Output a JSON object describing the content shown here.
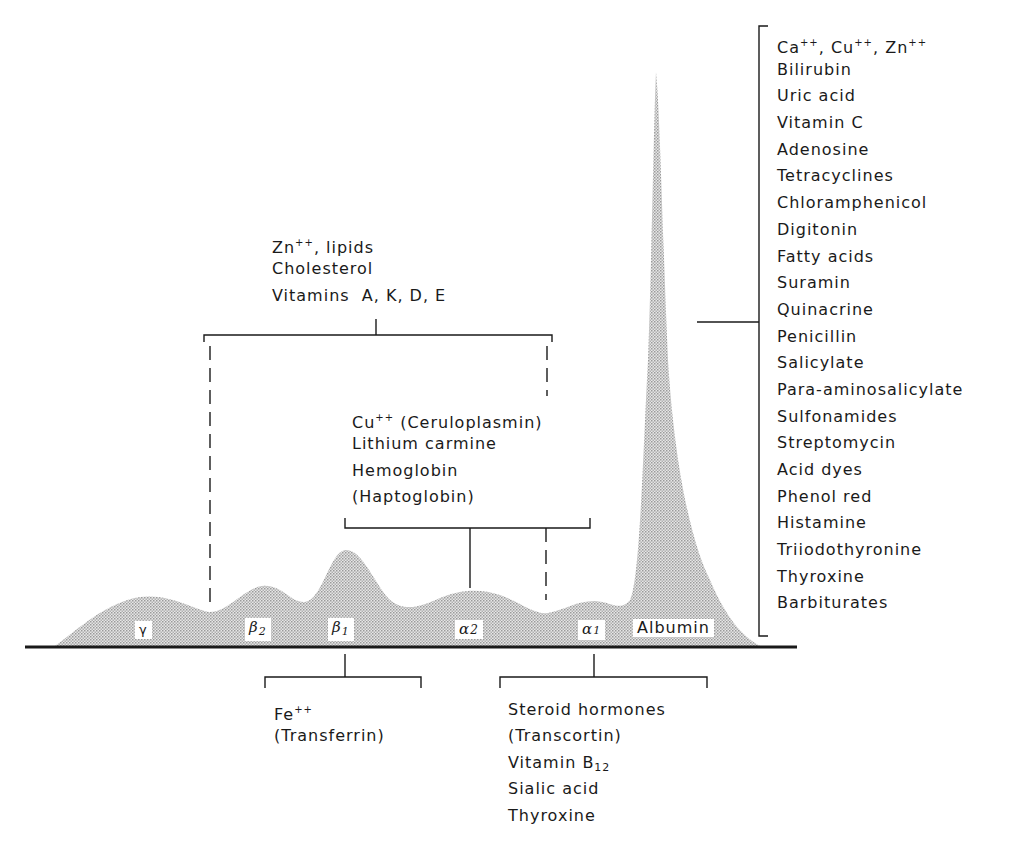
{
  "figure": {
    "fractions": [
      {
        "id": "gamma",
        "label": "γ"
      },
      {
        "id": "beta2",
        "label": "β",
        "sub": "2"
      },
      {
        "id": "beta1",
        "label": "β",
        "sub": "1"
      },
      {
        "id": "alpha2",
        "label": "α",
        "sub": "2"
      },
      {
        "id": "alpha1",
        "label": "α",
        "sub": "1"
      },
      {
        "id": "albumin",
        "label": "Albumin"
      }
    ],
    "colors": {
      "line": "#1a1a1a",
      "fill": "#c8c8c8",
      "background": "#ffffff"
    }
  },
  "groups": {
    "beta_group": {
      "binds_fractions": [
        "beta2",
        "beta1",
        "alpha2",
        "alpha1"
      ],
      "lines": [
        {
          "text": "Zn",
          "sup": "++",
          "rest": ", lipids"
        },
        {
          "text": "Cholesterol"
        },
        {
          "text": "Vitamins  A, K, D, E"
        }
      ]
    },
    "alpha2_group": {
      "binds_fractions": [
        "alpha2"
      ],
      "lines": [
        {
          "text": "Cu",
          "sup": "++",
          "rest": " (Ceruloplasmin)"
        },
        {
          "text": "Lithium carmine"
        },
        {
          "text": "Hemoglobin"
        },
        {
          "text": "(Haptoglobin)"
        }
      ]
    },
    "beta1_group": {
      "binds_fractions": [
        "beta1"
      ],
      "lines": [
        {
          "text": "Fe",
          "sup": "++"
        },
        {
          "text": "(Transferrin)"
        }
      ]
    },
    "alpha1_group": {
      "binds_fractions": [
        "alpha1"
      ],
      "lines": [
        {
          "text": "Steroid hormones"
        },
        {
          "text": "(Transcortin)"
        },
        {
          "text": "Vitamin B",
          "sub": "12"
        },
        {
          "text": "Sialic acid"
        },
        {
          "text": "Thyroxine"
        }
      ]
    },
    "albumin_group": {
      "binds_fractions": [
        "albumin"
      ],
      "lines": [
        {
          "text": "Ca",
          "sup": "++",
          "rest": ", Cu"
        },
        {
          "text": "Bilirubin"
        },
        {
          "text": "Uric acid"
        },
        {
          "text": "Vitamin C"
        },
        {
          "text": "Adenosine"
        },
        {
          "text": "Tetracyclines"
        },
        {
          "text": "Chloramphenicol"
        },
        {
          "text": "Digitonin"
        },
        {
          "text": "Fatty acids"
        },
        {
          "text": "Suramin"
        },
        {
          "text": "Quinacrine"
        },
        {
          "text": "Penicillin"
        },
        {
          "text": "Salicylate"
        },
        {
          "text": "Para-aminosalicylate"
        },
        {
          "text": "Sulfonamides"
        },
        {
          "text": "Streptomycin"
        },
        {
          "text": "Acid dyes"
        },
        {
          "text": "Phenol red"
        },
        {
          "text": "Histamine"
        },
        {
          "text": "Triiodothyronine"
        },
        {
          "text": "Thyroxine"
        },
        {
          "text": "Barbiturates"
        }
      ],
      "first_line_extra": {
        "sup2": "++",
        "mid": ", Zn",
        "sup3": "++"
      }
    }
  }
}
